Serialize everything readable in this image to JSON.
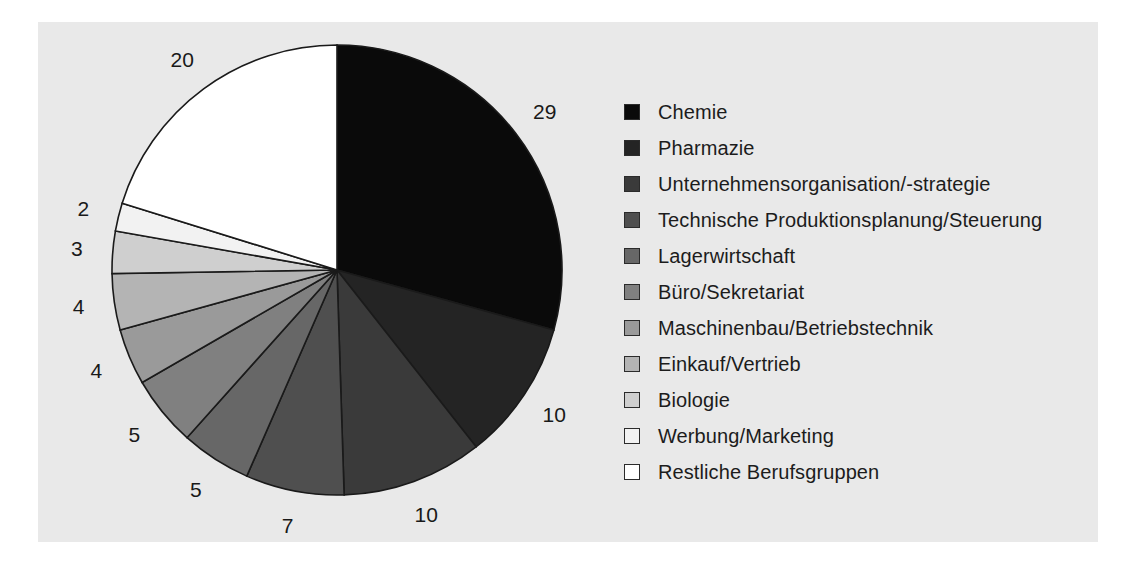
{
  "figure": {
    "background_color": "#ffffff",
    "panel_color": "#e9e9e9",
    "panel_border_color": "#e9e9e9"
  },
  "chart_data": {
    "type": "pie",
    "title": "",
    "subtitle": "",
    "xlabel": "",
    "ylabel": "",
    "grid": false,
    "legend_position": "right",
    "start_angle_deg": 90,
    "direction": "clockwise",
    "total": 99,
    "value_suffix": "",
    "categories": [
      "Chemie",
      "Pharmazie",
      "Unternehmensorganisation/-strategie",
      "Technische Produktionsplanung/Steuerung",
      "Lagerwirtschaft",
      "Büro/Sekretariat",
      "Maschinenbau/Betriebstechnik",
      "Einkauf/Vertrieb",
      "Biologie",
      "Werbung/Marketing",
      "Restliche Berufsgruppen"
    ],
    "values": [
      29,
      10,
      10,
      7,
      5,
      5,
      4,
      4,
      3,
      2,
      20
    ],
    "colors": [
      "#0a0a0a",
      "#242424",
      "#3a3a3a",
      "#4f4f4f",
      "#676767",
      "#808080",
      "#9a9a9a",
      "#b4b4b4",
      "#cfcfcf",
      "#f2f2f2",
      "#ffffff"
    ],
    "slice_edge_color": "#1a1a1a",
    "data_labels": [
      "29",
      "10",
      "10",
      "7",
      "5",
      "5",
      "4",
      "4",
      "3",
      "2",
      "20"
    ]
  },
  "legend": {
    "items": [
      {
        "label": "Chemie",
        "color": "#0a0a0a"
      },
      {
        "label": "Pharmazie",
        "color": "#242424"
      },
      {
        "label": "Unternehmensorganisation/-strategie",
        "color": "#3a3a3a"
      },
      {
        "label": "Technische Produktionsplanung/Steuerung",
        "color": "#4f4f4f"
      },
      {
        "label": "Lagerwirtschaft",
        "color": "#676767"
      },
      {
        "label": "Büro/Sekretariat",
        "color": "#808080"
      },
      {
        "label": "Maschinenbau/Betriebstechnik",
        "color": "#9a9a9a"
      },
      {
        "label": "Einkauf/Vertrieb",
        "color": "#b4b4b4"
      },
      {
        "label": "Biologie",
        "color": "#cfcfcf"
      },
      {
        "label": "Werbung/Marketing",
        "color": "#f2f2f2"
      },
      {
        "label": "Restliche Berufsgruppen",
        "color": "#ffffff"
      }
    ]
  }
}
